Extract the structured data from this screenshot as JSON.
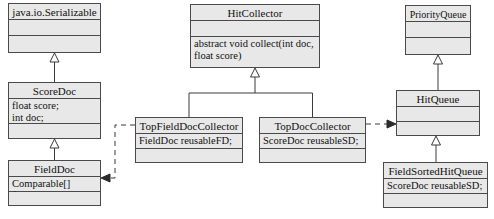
{
  "diagram": {
    "type": "uml-class-diagram",
    "canvas": {
      "width": 494,
      "height": 219,
      "background": "#ffffff"
    },
    "style": {
      "box_fill": "#e8e8e8",
      "box_border": "#4a4a4a",
      "text_color": "#111111",
      "edge_color": "#3a3a3a"
    }
  },
  "classes": [
    {
      "id": "serializable",
      "name": "java.io.Serializable",
      "attributes": "",
      "operations": "",
      "x": 8,
      "y": 3,
      "w": 93,
      "h": 50,
      "name_h": 16,
      "attrs_h": 16
    },
    {
      "id": "scoredoc",
      "name": "ScoreDoc",
      "attributes": "float score;\nint doc;",
      "operations": "",
      "x": 8,
      "y": 82,
      "w": 93,
      "h": 57,
      "name_h": 16,
      "attrs_h": 25
    },
    {
      "id": "fielddoc",
      "name": "FieldDoc",
      "attributes": "Comparable[] fields;",
      "operations": "",
      "x": 8,
      "y": 160,
      "w": 93,
      "h": 46,
      "name_h": 16,
      "attrs_h": 15
    },
    {
      "id": "hitcollector",
      "name": "HitCollector",
      "attributes": "",
      "operations": "abstract void collect(int doc,\nfloat score)",
      "x": 190,
      "y": 4,
      "w": 130,
      "h": 64,
      "name_h": 16,
      "attrs_h": 16
    },
    {
      "id": "topfielddoccollector",
      "name": "TopFieldDocCollector",
      "attributes": "FieldDoc reusableFD;",
      "operations": "",
      "x": 135,
      "y": 117,
      "w": 108,
      "h": 46,
      "name_h": 16,
      "attrs_h": 15
    },
    {
      "id": "topdoccollector",
      "name": "TopDocCollector",
      "attributes": "ScoreDoc reusableSD;",
      "operations": "",
      "x": 259,
      "y": 117,
      "w": 107,
      "h": 46,
      "name_h": 16,
      "attrs_h": 15
    },
    {
      "id": "priorityqueue",
      "name": "PriorityQueue",
      "attributes": "",
      "operations": "",
      "x": 405,
      "y": 5,
      "w": 66,
      "h": 50,
      "name_h": 16,
      "attrs_h": 16
    },
    {
      "id": "hitqueue",
      "name": "HitQueue",
      "attributes": "",
      "operations": "",
      "x": 396,
      "y": 90,
      "w": 84,
      "h": 46,
      "name_h": 16,
      "attrs_h": 15
    },
    {
      "id": "fieldsortedhitqueue",
      "name": "FieldSortedHitQueue",
      "attributes": "ScoreDoc reusableSD;",
      "operations": "",
      "x": 383,
      "y": 162,
      "w": 105,
      "h": 46,
      "name_h": 16,
      "attrs_h": 15
    }
  ],
  "relationships": [
    {
      "id": "rel-scoredoc-serializable",
      "kind": "generalization",
      "from": "ScoreDoc",
      "to": "java.io.Serializable",
      "style": "solid-hollow-triangle"
    },
    {
      "id": "rel-fielddoc-scoredoc",
      "kind": "generalization",
      "from": "FieldDoc",
      "to": "ScoreDoc",
      "style": "solid-hollow-triangle"
    },
    {
      "id": "rel-topfielddoccollector-hitcollector",
      "kind": "generalization",
      "from": "TopFieldDocCollector",
      "to": "HitCollector",
      "style": "solid-hollow-triangle"
    },
    {
      "id": "rel-topdoccollector-hitcollector",
      "kind": "generalization",
      "from": "TopDocCollector",
      "to": "HitCollector",
      "style": "solid-hollow-triangle"
    },
    {
      "id": "rel-hitqueue-priorityqueue",
      "kind": "generalization",
      "from": "HitQueue",
      "to": "PriorityQueue",
      "style": "solid-hollow-triangle"
    },
    {
      "id": "rel-fieldsortedhitqueue-hitqueue",
      "kind": "generalization",
      "from": "FieldSortedHitQueue",
      "to": "HitQueue",
      "style": "solid-hollow-triangle"
    },
    {
      "id": "rel-topfielddoccollector-fielddoc",
      "kind": "dependency",
      "from": "TopFieldDocCollector",
      "to": "FieldDoc",
      "style": "dashed-open-arrow"
    },
    {
      "id": "rel-topdoccollector-hitqueue",
      "kind": "dependency",
      "from": "TopDocCollector",
      "to": "HitQueue",
      "style": "dashed-open-arrow"
    }
  ]
}
